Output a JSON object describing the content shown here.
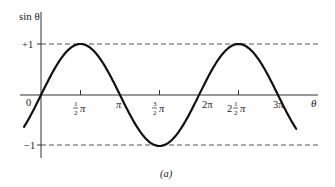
{
  "chart_data": {
    "type": "line",
    "title": "",
    "xlabel": "θ",
    "ylabel": "sin θ",
    "caption": "(a)",
    "function": "sin(theta)",
    "xlim_radians_over_pi": [
      -0.215,
      3.23
    ],
    "ylim": [
      -1,
      1
    ],
    "x_ticks": [
      {
        "value_over_pi": 0,
        "label": "0"
      },
      {
        "value_over_pi": 0.5,
        "label": "½π"
      },
      {
        "value_over_pi": 1,
        "label": "π"
      },
      {
        "value_over_pi": 1.5,
        "label": "3/2π"
      },
      {
        "value_over_pi": 2,
        "label": "2π"
      },
      {
        "value_over_pi": 2.5,
        "label": "2½π"
      },
      {
        "value_over_pi": 3,
        "label": "3π"
      }
    ],
    "y_ticks": [
      {
        "value": 1,
        "label": "+1"
      },
      {
        "value": -1,
        "label": "−1"
      }
    ],
    "reference_lines": [
      {
        "y": 1,
        "style": "dashed"
      },
      {
        "y": -1,
        "style": "dashed"
      }
    ],
    "key_points": [
      {
        "theta_over_pi": 0,
        "y": 0
      },
      {
        "theta_over_pi": 0.5,
        "y": 1
      },
      {
        "theta_over_pi": 1,
        "y": 0
      },
      {
        "theta_over_pi": 1.5,
        "y": -1
      },
      {
        "theta_over_pi": 2,
        "y": 0
      },
      {
        "theta_over_pi": 2.5,
        "y": 1
      },
      {
        "theta_over_pi": 3,
        "y": 0
      }
    ],
    "grid": false,
    "legend": null
  },
  "labels": {
    "y_axis": "sin θ",
    "x_axis": "θ",
    "plus_one": "+1",
    "minus_one": "−1",
    "origin": "0",
    "pi": "π",
    "two_pi": "2π",
    "three_pi": "3π",
    "caption": "(a)"
  },
  "colors": {
    "curve": "#111111",
    "axis": "#333333",
    "dashed": "#555555"
  }
}
